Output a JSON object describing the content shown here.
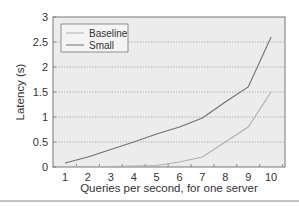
{
  "chart_data": {
    "type": "line",
    "title": "",
    "xlabel": "Queries per second, for one server",
    "ylabel": "Latency (s)",
    "x": [
      1,
      2,
      3,
      4,
      5,
      6,
      7,
      8,
      9,
      10
    ],
    "x_ticks": [
      "1",
      "2",
      "3",
      "4",
      "5",
      "6",
      "7",
      "8",
      "9",
      "10"
    ],
    "y_ticks": [
      "0",
      "0.5",
      "1",
      "1.5",
      "2",
      "2.5",
      "3"
    ],
    "ylim": [
      0,
      3
    ],
    "xlim": [
      0.5,
      11.1
    ],
    "grid": "horizontal dotted",
    "legend_position": "upper left",
    "series": [
      {
        "name": "Baseline",
        "color": "#b0b0b0",
        "values": [
          0.01,
          0.01,
          0.01,
          0.02,
          0.03,
          0.1,
          0.2,
          0.5,
          0.8,
          1.5
        ]
      },
      {
        "name": "Small",
        "color": "#707070",
        "values": [
          0.08,
          0.2,
          0.35,
          0.5,
          0.66,
          0.8,
          0.98,
          1.3,
          1.6,
          2.6
        ]
      }
    ]
  },
  "legend": {
    "items": [
      {
        "label": "Baseline"
      },
      {
        "label": "Small"
      }
    ]
  },
  "colors": {
    "plot_bg": "#ececec",
    "frame": "#777777",
    "grid": "#9a9a9a",
    "rule": "#888888"
  }
}
